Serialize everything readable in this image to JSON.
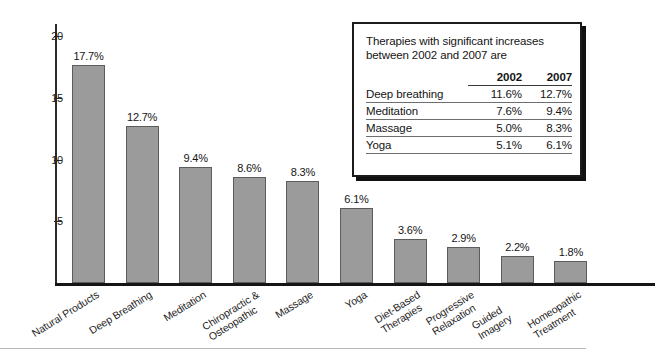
{
  "chart_data": {
    "type": "bar",
    "title": "",
    "xlabel": "",
    "ylabel": "",
    "ylim": [
      0,
      21
    ],
    "yticks": [
      5,
      10,
      15,
      20
    ],
    "ytick_labels": [
      "5",
      "10",
      "15",
      "20"
    ],
    "grid": false,
    "legend": "none",
    "categories": [
      "Natural Products",
      "Deep Breathing",
      "Meditation",
      "Chiropractic &\nOsteopathic",
      "Massage",
      "Yoga",
      "Diet-Based\nTherapies",
      "Progressive\nRelaxation",
      "Guided Imagery",
      "Homeopathic\nTreatment"
    ],
    "values": [
      17.7,
      12.7,
      9.4,
      8.6,
      8.3,
      6.1,
      3.6,
      2.9,
      2.2,
      1.8
    ],
    "data_labels": [
      "17.7%",
      "12.7%",
      "9.4%",
      "8.6%",
      "8.3%",
      "6.1%",
      "3.6%",
      "2.9%",
      "2.2%",
      "1.8%"
    ],
    "bar_color": "#9b9b9b",
    "bar_edge_color": "#5c5c5c",
    "axis_color": "#1b1b1b"
  },
  "infobox": {
    "title": "Therapies with significant increases\nbetween 2002 and 2007 are",
    "columns": [
      "",
      "2002",
      "2007"
    ],
    "rows": [
      {
        "name": "Deep breathing",
        "y2002": "11.6%",
        "y2007": "12.7%"
      },
      {
        "name": "Meditation",
        "y2002": "7.6%",
        "y2007": "9.4%"
      },
      {
        "name": "Massage",
        "y2002": "5.0%",
        "y2007": "8.3%"
      },
      {
        "name": "Yoga",
        "y2002": "5.1%",
        "y2007": "6.1%"
      }
    ]
  }
}
